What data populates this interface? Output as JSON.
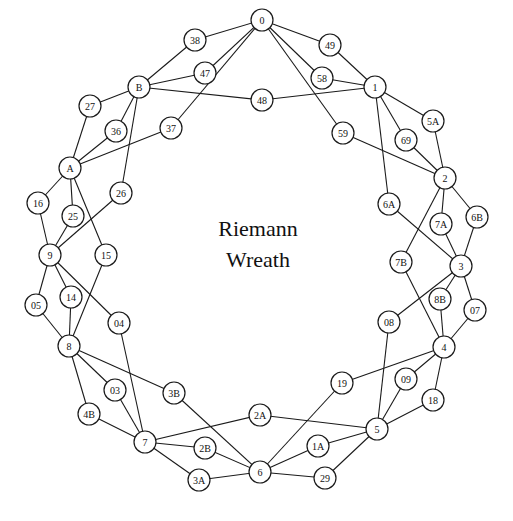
{
  "title": {
    "line1": "Riemann",
    "line2": "Wreath"
  },
  "style": {
    "stroke_color": "#1a1a1a",
    "node_fill": "#ffffff",
    "background": "#ffffff",
    "node_radius": 11
  },
  "nodes": [
    {
      "id": "0",
      "x": 262,
      "y": 20
    },
    {
      "id": "38",
      "x": 195,
      "y": 40
    },
    {
      "id": "49",
      "x": 330,
      "y": 45
    },
    {
      "id": "47",
      "x": 205,
      "y": 73
    },
    {
      "id": "58",
      "x": 322,
      "y": 78
    },
    {
      "id": "B",
      "x": 139,
      "y": 87
    },
    {
      "id": "48",
      "x": 262,
      "y": 100
    },
    {
      "id": "1",
      "x": 375,
      "y": 87
    },
    {
      "id": "27",
      "x": 90,
      "y": 106
    },
    {
      "id": "36",
      "x": 116,
      "y": 131
    },
    {
      "id": "37",
      "x": 171,
      "y": 128
    },
    {
      "id": "59",
      "x": 343,
      "y": 133
    },
    {
      "id": "5A",
      "x": 433,
      "y": 121
    },
    {
      "id": "69",
      "x": 406,
      "y": 140
    },
    {
      "id": "A",
      "x": 70,
      "y": 168
    },
    {
      "id": "2",
      "x": 445,
      "y": 178
    },
    {
      "id": "26",
      "x": 121,
      "y": 193
    },
    {
      "id": "16",
      "x": 38,
      "y": 203
    },
    {
      "id": "25",
      "x": 73,
      "y": 216
    },
    {
      "id": "6A",
      "x": 389,
      "y": 204
    },
    {
      "id": "7A",
      "x": 441,
      "y": 224
    },
    {
      "id": "6B",
      "x": 477,
      "y": 217
    },
    {
      "id": "9",
      "x": 50,
      "y": 255
    },
    {
      "id": "15",
      "x": 106,
      "y": 255
    },
    {
      "id": "3",
      "x": 461,
      "y": 266
    },
    {
      "id": "7B",
      "x": 401,
      "y": 262
    },
    {
      "id": "05",
      "x": 36,
      "y": 305
    },
    {
      "id": "14",
      "x": 71,
      "y": 297
    },
    {
      "id": "04",
      "x": 119,
      "y": 323
    },
    {
      "id": "8B",
      "x": 440,
      "y": 299
    },
    {
      "id": "07",
      "x": 475,
      "y": 310
    },
    {
      "id": "08",
      "x": 389,
      "y": 322
    },
    {
      "id": "8",
      "x": 69,
      "y": 346
    },
    {
      "id": "4",
      "x": 444,
      "y": 347
    },
    {
      "id": "03",
      "x": 115,
      "y": 390
    },
    {
      "id": "3B",
      "x": 174,
      "y": 393
    },
    {
      "id": "19",
      "x": 342,
      "y": 383
    },
    {
      "id": "09",
      "x": 406,
      "y": 379
    },
    {
      "id": "4B",
      "x": 89,
      "y": 414
    },
    {
      "id": "18",
      "x": 433,
      "y": 400
    },
    {
      "id": "7",
      "x": 145,
      "y": 442
    },
    {
      "id": "2A",
      "x": 260,
      "y": 415
    },
    {
      "id": "5",
      "x": 377,
      "y": 429
    },
    {
      "id": "2B",
      "x": 205,
      "y": 448
    },
    {
      "id": "1A",
      "x": 318,
      "y": 446
    },
    {
      "id": "6",
      "x": 260,
      "y": 472
    },
    {
      "id": "3A",
      "x": 199,
      "y": 480
    },
    {
      "id": "29",
      "x": 325,
      "y": 478
    }
  ],
  "edges": [
    [
      "0",
      "38"
    ],
    [
      "0",
      "47"
    ],
    [
      "0",
      "37"
    ],
    [
      "0",
      "49"
    ],
    [
      "0",
      "58"
    ],
    [
      "0",
      "59"
    ],
    [
      "1",
      "49"
    ],
    [
      "1",
      "58"
    ],
    [
      "1",
      "48"
    ],
    [
      "1",
      "5A"
    ],
    [
      "1",
      "69"
    ],
    [
      "1",
      "6A"
    ],
    [
      "2",
      "5A"
    ],
    [
      "2",
      "69"
    ],
    [
      "2",
      "59"
    ],
    [
      "2",
      "7A"
    ],
    [
      "2",
      "6B"
    ],
    [
      "2",
      "7B"
    ],
    [
      "3",
      "6B"
    ],
    [
      "3",
      "7A"
    ],
    [
      "3",
      "6A"
    ],
    [
      "3",
      "8B"
    ],
    [
      "3",
      "07"
    ],
    [
      "3",
      "08"
    ],
    [
      "4",
      "8B"
    ],
    [
      "4",
      "07"
    ],
    [
      "4",
      "7B"
    ],
    [
      "4",
      "09"
    ],
    [
      "4",
      "18"
    ],
    [
      "4",
      "19"
    ],
    [
      "5",
      "09"
    ],
    [
      "5",
      "18"
    ],
    [
      "5",
      "08"
    ],
    [
      "5",
      "1A"
    ],
    [
      "5",
      "29"
    ],
    [
      "5",
      "2A"
    ],
    [
      "6",
      "1A"
    ],
    [
      "6",
      "29"
    ],
    [
      "6",
      "19"
    ],
    [
      "6",
      "2B"
    ],
    [
      "6",
      "3A"
    ],
    [
      "6",
      "3B"
    ],
    [
      "7",
      "2B"
    ],
    [
      "7",
      "3A"
    ],
    [
      "7",
      "2A"
    ],
    [
      "7",
      "03"
    ],
    [
      "7",
      "4B"
    ],
    [
      "7",
      "04"
    ],
    [
      "8",
      "03"
    ],
    [
      "8",
      "4B"
    ],
    [
      "8",
      "3B"
    ],
    [
      "8",
      "05"
    ],
    [
      "8",
      "14"
    ],
    [
      "8",
      "15"
    ],
    [
      "9",
      "05"
    ],
    [
      "9",
      "14"
    ],
    [
      "9",
      "04"
    ],
    [
      "9",
      "16"
    ],
    [
      "9",
      "25"
    ],
    [
      "9",
      "26"
    ],
    [
      "A",
      "16"
    ],
    [
      "A",
      "25"
    ],
    [
      "A",
      "15"
    ],
    [
      "A",
      "27"
    ],
    [
      "A",
      "36"
    ],
    [
      "A",
      "37"
    ],
    [
      "B",
      "27"
    ],
    [
      "B",
      "36"
    ],
    [
      "B",
      "26"
    ],
    [
      "B",
      "38"
    ],
    [
      "B",
      "47"
    ],
    [
      "B",
      "48"
    ]
  ]
}
